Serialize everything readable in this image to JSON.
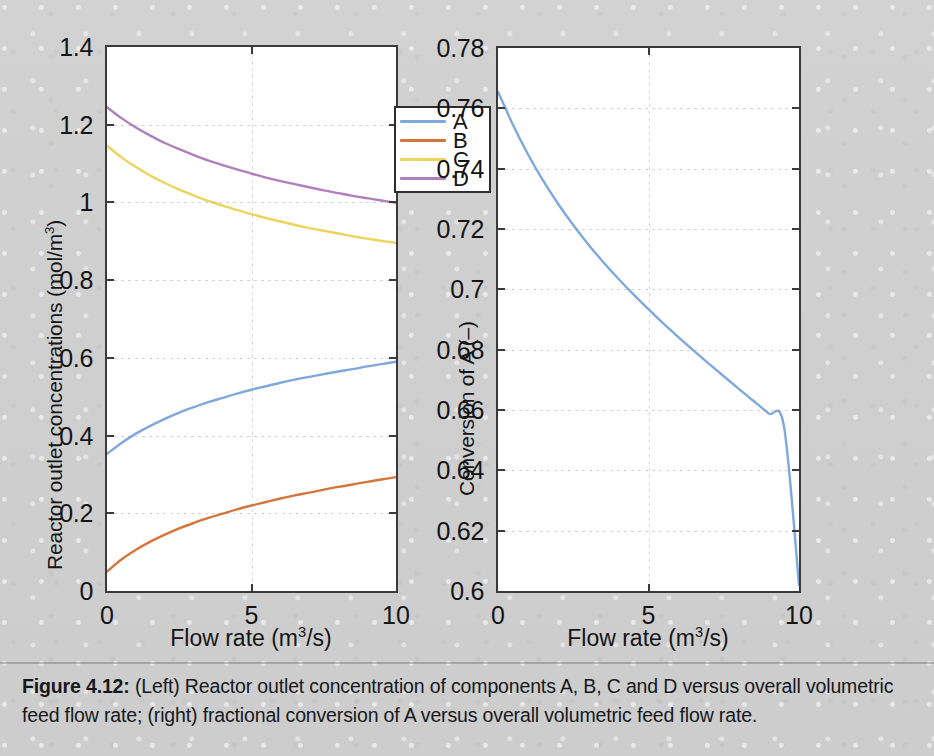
{
  "figure": {
    "caption_label": "Figure 4.12:",
    "caption_text": " (Left) Reactor outlet concentration of components A, B, C and D versus overall volumetric feed flow rate; (right) fractional conversion of A versus overall volumetric feed flow rate."
  },
  "colors": {
    "series_a": "#7FA8DC",
    "series_b": "#D4763C",
    "series_c": "#EDD45C",
    "series_d": "#B07FBE",
    "axis": "#3a3a3a",
    "grid": "#8a8a8a",
    "panel_bg": "#ffffff",
    "page_bg": "#cfcfd0"
  },
  "chart_data": [
    {
      "id": "left",
      "type": "line",
      "title": "",
      "xlabel": "Flow rate (m3/s)",
      "xlabel_parts": {
        "pre": "Flow rate (m",
        "sup": "3",
        "post": "/s)"
      },
      "ylabel": "Reactor outlet concentrations (mol/m3)",
      "ylabel_parts": {
        "pre": "Reactor outlet concentrations (mol/m",
        "sup": "3",
        "post": ")"
      },
      "xlim": [
        0,
        10
      ],
      "ylim": [
        0,
        1.4
      ],
      "xticks": [
        0,
        5,
        10
      ],
      "xtick_labels": [
        "0",
        "5",
        "10"
      ],
      "yticks": [
        0,
        0.2,
        0.4,
        0.6,
        0.8,
        1,
        1.2,
        1.4
      ],
      "ytick_labels": [
        "0",
        "0.2",
        "0.4",
        "0.6",
        "0.8",
        "1",
        "1.2",
        "1.4"
      ],
      "grid": true,
      "legend_position": "top-right",
      "x": [
        0,
        0.5,
        1,
        1.5,
        2,
        2.5,
        3,
        3.5,
        4,
        4.5,
        5,
        5.5,
        6,
        6.5,
        7,
        7.5,
        8,
        8.5,
        9,
        9.5,
        10
      ],
      "series": [
        {
          "name": "A",
          "color": "#7FA8DC",
          "values": [
            0.353,
            0.381,
            0.405,
            0.425,
            0.443,
            0.459,
            0.473,
            0.486,
            0.497,
            0.508,
            0.518,
            0.527,
            0.536,
            0.544,
            0.551,
            0.558,
            0.565,
            0.571,
            0.578,
            0.584,
            0.59
          ]
        },
        {
          "name": "B",
          "color": "#D4763C",
          "values": [
            0.05,
            0.081,
            0.106,
            0.127,
            0.145,
            0.161,
            0.175,
            0.188,
            0.199,
            0.21,
            0.22,
            0.229,
            0.238,
            0.246,
            0.253,
            0.261,
            0.268,
            0.274,
            0.281,
            0.287,
            0.293
          ]
        },
        {
          "name": "C",
          "color": "#EDD45C",
          "values": [
            1.146,
            1.116,
            1.091,
            1.069,
            1.05,
            1.033,
            1.018,
            1.004,
            0.992,
            0.98,
            0.97,
            0.96,
            0.951,
            0.942,
            0.934,
            0.927,
            0.92,
            0.913,
            0.907,
            0.901,
            0.896
          ]
        },
        {
          "name": "D",
          "color": "#B07FBE",
          "values": [
            1.245,
            1.217,
            1.193,
            1.172,
            1.153,
            1.137,
            1.122,
            1.108,
            1.096,
            1.085,
            1.074,
            1.064,
            1.055,
            1.047,
            1.039,
            1.031,
            1.024,
            1.017,
            1.011,
            1.005,
            0.999
          ]
        }
      ],
      "legend_entries": [
        "A",
        "B",
        "C",
        "D"
      ]
    },
    {
      "id": "right",
      "type": "line",
      "title": "",
      "xlabel": "Flow rate (m3/s)",
      "xlabel_parts": {
        "pre": "Flow rate (m",
        "sup": "3",
        "post": "/s)"
      },
      "ylabel": "Conversion of A (–)",
      "xlim": [
        0,
        10
      ],
      "ylim": [
        0.6,
        0.78
      ],
      "xticks": [
        0,
        5,
        10
      ],
      "xtick_labels": [
        "0",
        "5",
        "10"
      ],
      "yticks": [
        0.6,
        0.62,
        0.64,
        0.66,
        0.68,
        0.7,
        0.72,
        0.74,
        0.76,
        0.78
      ],
      "ytick_labels": [
        "0.6",
        "0.62",
        "0.64",
        "0.66",
        "0.68",
        "0.7",
        "0.72",
        "0.74",
        "0.76",
        "0.78"
      ],
      "grid": true,
      "x": [
        0,
        0.5,
        1,
        1.5,
        2,
        2.5,
        3,
        3.5,
        4,
        4.5,
        5,
        5.5,
        6,
        6.5,
        7,
        7.5,
        8,
        8.5,
        9,
        9.5,
        10
      ],
      "series": [
        {
          "name": "Conversion of A",
          "color": "#7FA8DC",
          "values": [
            0.7655,
            0.7545,
            0.7447,
            0.736,
            0.7283,
            0.7213,
            0.7149,
            0.709,
            0.7035,
            0.6983,
            0.6934,
            0.6886,
            0.6841,
            0.6797,
            0.6754,
            0.6712,
            0.667,
            0.6629,
            0.6588,
            0.6546,
            0.602
          ]
        }
      ],
      "legend_entries": []
    }
  ]
}
